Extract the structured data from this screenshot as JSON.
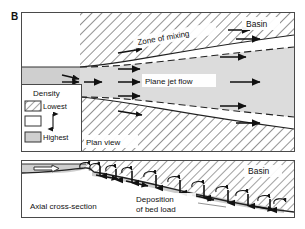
{
  "figure": {
    "panel_label": "B"
  },
  "plan_view": {
    "name": "plan-view-panel",
    "basin_label": "Basin",
    "view_label": "Plan view",
    "zone_of_mixing_label": "Zone of mixing",
    "plane_jet_flow_label": "Plane jet flow",
    "legend": {
      "title": "Density",
      "highest_label": "Highest",
      "lowest_label": "Lowest",
      "swatches": [
        {
          "key": "lowest",
          "pattern": "diagonal-hatch",
          "label": "Lowest"
        },
        {
          "key": "middle",
          "pattern": "blank",
          "label": ""
        },
        {
          "key": "highest",
          "pattern": "gray-fill",
          "label": "Highest"
        }
      ],
      "gradient_arrow": "double-headed-vertical-arrow"
    },
    "arrow_count_flow": 9,
    "inlet_arrow_count": 3
  },
  "cross_section_view": {
    "name": "axial-cross-section-panel",
    "basin_label": "Basin",
    "view_label": "Axial cross-section",
    "deposition_label_line1": "Deposition",
    "deposition_label_line2": "of bed load",
    "inflow_arrow": "hollow-arrow-right",
    "settling_arrow_count": 9,
    "vortex_curl_count": 11
  },
  "colors": {
    "ink": "#111111",
    "frame": "#4a4a4a",
    "hatch_line": "#6e6e6e",
    "hatch_bg": "#ffffff",
    "jet_fill": "#d9d9d9",
    "channel_fill": "#cfcfcf",
    "deposit_fill": "#c9c9c9",
    "page_bg": "#ffffff"
  }
}
